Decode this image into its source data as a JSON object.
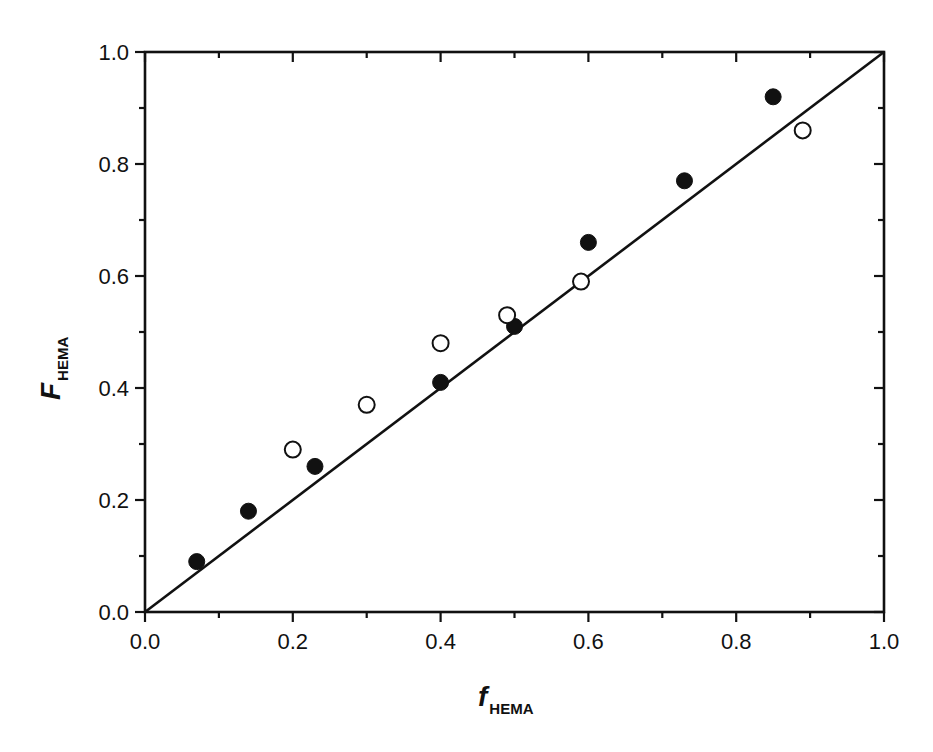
{
  "chart_data": {
    "type": "scatter",
    "title": "",
    "xlabel": "f_HEMA",
    "xlabel_main": "f",
    "xlabel_sub": "HEMA",
    "ylabel": "F_HEMA",
    "ylabel_main": "F",
    "ylabel_sub": "HEMA",
    "xlim": [
      0.0,
      1.0
    ],
    "ylim": [
      0.0,
      1.0
    ],
    "xticks": [
      "0.0",
      "0.2",
      "0.4",
      "0.6",
      "0.8",
      "1.0"
    ],
    "yticks": [
      "0.0",
      "0.2",
      "0.4",
      "0.6",
      "0.8",
      "1.0"
    ],
    "minor_tick_step": 0.1,
    "grid": false,
    "legend": "none",
    "series": [
      {
        "name": "filled circles",
        "marker": "filled-circle",
        "x": [
          0.07,
          0.14,
          0.23,
          0.4,
          0.5,
          0.6,
          0.73,
          0.85
        ],
        "y": [
          0.09,
          0.18,
          0.26,
          0.41,
          0.51,
          0.66,
          0.77,
          0.92
        ]
      },
      {
        "name": "open circles",
        "marker": "open-circle",
        "x": [
          0.2,
          0.3,
          0.4,
          0.49,
          0.59,
          0.89
        ],
        "y": [
          0.29,
          0.37,
          0.48,
          0.53,
          0.59,
          0.86
        ]
      },
      {
        "name": "fit line",
        "marker": "line",
        "x": [
          0.0,
          1.0
        ],
        "y": [
          0.0,
          1.0
        ]
      }
    ]
  },
  "colors": {
    "ink": "#111111",
    "background": "#ffffff"
  }
}
